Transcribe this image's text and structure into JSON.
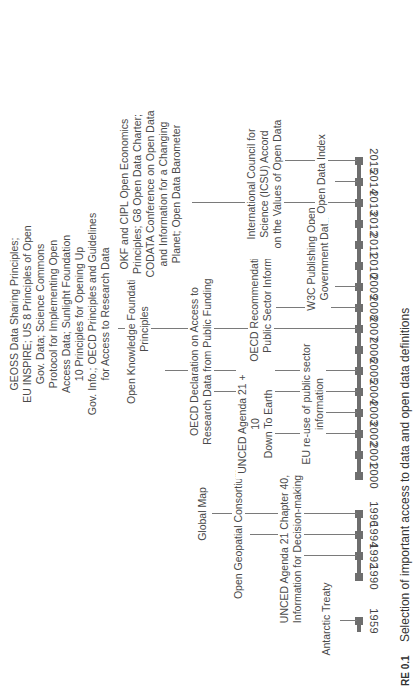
{
  "figure": {
    "caption_label": "RE 0.1",
    "caption_text": "Selection of important access to data and open data definitions"
  },
  "timeline": {
    "axis_color": "#6e6e6e",
    "years": [
      "1959",
      "1990",
      "1992",
      "1994",
      "1996",
      "2000",
      "2001",
      "2002",
      "2003",
      "2004",
      "2005",
      "2006",
      "2007",
      "2008",
      "2009",
      "2010",
      "2011",
      "2012",
      "2013",
      "2014",
      "2015"
    ]
  },
  "events": [
    {
      "year": "1959",
      "text": "Antarctic Treaty"
    },
    {
      "year": "1992",
      "text": "UNCED Agenda 21 Chapter 40, Information for Decision-making"
    },
    {
      "year": "1994",
      "text": "Open Geopatial Consortium"
    },
    {
      "year": "1996",
      "text": "Global Map"
    },
    {
      "year": "2002",
      "text": "UNCED Agenda 21 + 10 Down To Earth"
    },
    {
      "year": "2003",
      "text": "EU re-use of public sector information"
    },
    {
      "year": "2004",
      "text": "OECD Declaration on Access to Research Data from Public Funding"
    },
    {
      "year": "2005",
      "text": "Open Knowledge Foundation 11 Principles"
    },
    {
      "year": "2007",
      "text": "GEOSS Data Sharing Principles; EU INSPIRE; US 8 Principles of Open Gov. Data; Science Commons Protocol for Implementing Open Access Data; Sunlight Foundation 10 Principles for Opening Up Gov. Info.; OECD Principles and Guidelines for Access to Research Data"
    },
    {
      "year": "2008",
      "text": "OECD Recommendations on Public Sector Information"
    },
    {
      "year": "2009",
      "text": "W3C Publishing Open Government Data"
    },
    {
      "year": "2013",
      "text": "OKF and CIPL Open Economics Principles; G8 Open Data Charter; CODATA Conference on Open Data and Information for a Changing Planet; Open Data Barometer"
    },
    {
      "year": "2014",
      "text": "International Council for Science (ICSU) Accord on the Values of Open Data"
    },
    {
      "year": "2015",
      "text": "Open Data Index"
    }
  ],
  "labels": {
    "antarctic": [
      "Antarctic Treaty"
    ],
    "unced40": [
      "UNCED Agenda 21 Chapter 40,",
      "Information for Decision-making"
    ],
    "ogc": [
      "Open Geopatial Consortium"
    ],
    "globalmap": [
      "Global Map"
    ],
    "unced10": [
      "UNCED Agenda 21 + 10",
      "Down To Earth"
    ],
    "eureuse": [
      "EU re-use of public sector",
      "information"
    ],
    "oecd_decl": [
      "OECD Declaration on Access to",
      "Research Data from Public Funding"
    ],
    "okf11": [
      "Open Knowledge Foundation 11",
      "Principles"
    ],
    "geoss": [
      "GEOSS Data Sharing Principles;",
      "EU INSPIRE; US 8 Principles of Open",
      "Gov. Data; Science Commons",
      "Protocol for Implementing Open",
      "Access Data; Sunlight Foundation",
      "10 Principles for Opening Up",
      "Gov. Info.; OECD Principles and Guidelines",
      "for Access to Research Data"
    ],
    "oecd_rec": [
      "OECD Recommendations on",
      "Public Sector Information"
    ],
    "w3c": [
      "W3C Publishing Open",
      "Government Data"
    ],
    "okf_cipl": [
      "OKF and CIPL Open Economics",
      "Principles; G8 Open Data Charter;",
      "CODATA Conference on Open Data",
      "and Information for a Changing",
      "Planet; Open Data Barometer"
    ],
    "icsu": [
      "International Council for",
      "Science (ICSU) Accord",
      "on the Values of Open Data"
    ],
    "odi": [
      "Open Data Index"
    ]
  }
}
